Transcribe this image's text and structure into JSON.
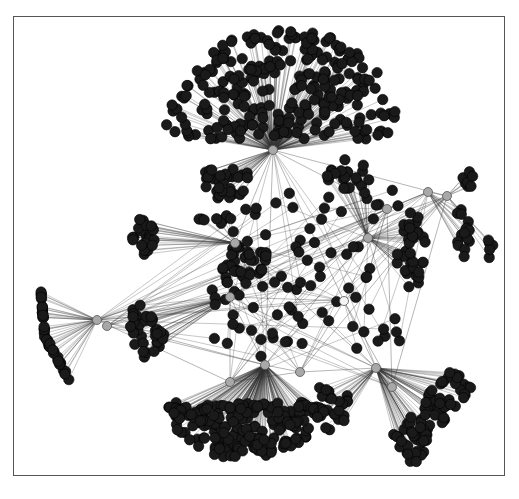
{
  "figure": {
    "type": "network-graph",
    "frame_color": "#555555",
    "edge_color": "#333333",
    "leaf_color": "#1a1a1a",
    "hub_color": "#a8a8a8",
    "hub_stroke": "#555555",
    "leaf_radius": 5.2,
    "hub_radius": 4.5
  },
  "hubs": [
    {
      "id": "h_top",
      "x": 273,
      "y": 150
    },
    {
      "id": "h_left_mid",
      "x": 235,
      "y": 243
    },
    {
      "id": "h_left_low",
      "x": 230,
      "y": 297
    },
    {
      "id": "h_far_left_a",
      "x": 97,
      "y": 320
    },
    {
      "id": "h_far_left_b",
      "x": 107,
      "y": 326
    },
    {
      "id": "h_bottom_mid",
      "x": 265,
      "y": 365
    },
    {
      "id": "h_bottom_right",
      "x": 376,
      "y": 368
    },
    {
      "id": "h_right_mid",
      "x": 368,
      "y": 238
    },
    {
      "id": "h_right_a",
      "x": 387,
      "y": 209
    },
    {
      "id": "h_right_b",
      "x": 428,
      "y": 192
    },
    {
      "id": "h_right_c",
      "x": 447,
      "y": 196
    },
    {
      "id": "h_low_a",
      "x": 230,
      "y": 382
    },
    {
      "id": "h_low_b",
      "x": 300,
      "y": 372
    },
    {
      "id": "h_low_c",
      "x": 392,
      "y": 387
    },
    {
      "id": "h_center_white",
      "x": 344,
      "y": 301
    }
  ],
  "clusters": [
    {
      "name": "top-dome",
      "hub": 0,
      "shape": "dome",
      "cx": 283,
      "cy": 100,
      "rx": 118,
      "ry": 72,
      "count": 260
    },
    {
      "name": "upper-left-blob",
      "hub": 0,
      "shape": "ellipse",
      "cx": 224,
      "cy": 183,
      "rx": 30,
      "ry": 16,
      "count": 30
    },
    {
      "name": "upper-left-small",
      "hub": 1,
      "shape": "ellipse",
      "cx": 215,
      "cy": 219,
      "rx": 16,
      "ry": 6,
      "count": 8
    },
    {
      "name": "mid-center-blob",
      "hub": 1,
      "shape": "ellipse",
      "cx": 245,
      "cy": 262,
      "rx": 26,
      "ry": 18,
      "count": 30
    },
    {
      "name": "left-column",
      "hub": 1,
      "shape": "ellipse",
      "cx": 144,
      "cy": 245,
      "rx": 12,
      "ry": 32,
      "count": 24
    },
    {
      "name": "left-oval",
      "hub": 2,
      "shape": "ellipse",
      "cx": 147,
      "cy": 328,
      "rx": 18,
      "ry": 32,
      "count": 34
    },
    {
      "name": "far-left-arc",
      "hub": 3,
      "shape": "arc",
      "cx": 45,
      "cy": 335,
      "rx": 20,
      "ry": 45,
      "count": 42
    },
    {
      "name": "bottom-left-dome",
      "hub": 5,
      "shape": "dome-down",
      "cx": 245,
      "cy": 432,
      "rx": 78,
      "ry": 46,
      "count": 200
    },
    {
      "name": "bottom-center-blob",
      "hub": 6,
      "shape": "ellipse",
      "cx": 332,
      "cy": 405,
      "rx": 18,
      "ry": 25,
      "count": 28
    },
    {
      "name": "bottom-right-arc",
      "hub": 6,
      "shape": "arc2",
      "cx": 432,
      "cy": 420,
      "rx": 40,
      "ry": 40,
      "count": 80
    },
    {
      "name": "right-oval",
      "hub": 7,
      "shape": "ellipse",
      "cx": 411,
      "cy": 250,
      "rx": 15,
      "ry": 38,
      "count": 34
    },
    {
      "name": "right-column",
      "hub": 9,
      "shape": "ellipse",
      "cx": 462,
      "cy": 235,
      "rx": 8,
      "ry": 28,
      "count": 16
    },
    {
      "name": "right-top-arc",
      "hub": 10,
      "shape": "ellipse",
      "cx": 468,
      "cy": 178,
      "rx": 6,
      "ry": 12,
      "count": 7
    },
    {
      "name": "right-small-col",
      "hub": 10,
      "shape": "ellipse",
      "cx": 490,
      "cy": 248,
      "rx": 4,
      "ry": 10,
      "count": 5
    },
    {
      "name": "upper-right-blob",
      "hub": 7,
      "shape": "ellipse",
      "cx": 348,
      "cy": 175,
      "rx": 22,
      "ry": 16,
      "count": 24
    },
    {
      "name": "center-scatter",
      "hub": 15,
      "shape": "scatter",
      "cx": 305,
      "cy": 275,
      "rx": 95,
      "ry": 85,
      "count": 90
    }
  ]
}
